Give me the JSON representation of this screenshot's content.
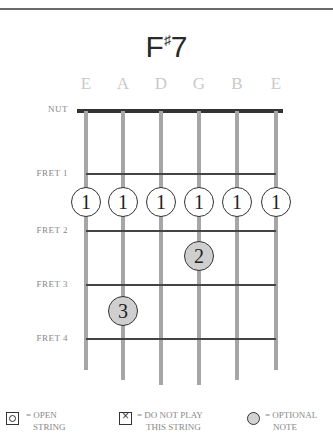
{
  "chord": {
    "root": "F",
    "accidental": "♯",
    "quality": "7"
  },
  "strings": [
    {
      "name": "E",
      "x": 86,
      "bottom": 370
    },
    {
      "name": "A",
      "x": 123,
      "bottom": 380
    },
    {
      "name": "D",
      "x": 161,
      "bottom": 385
    },
    {
      "name": "G",
      "x": 199,
      "bottom": 385
    },
    {
      "name": "B",
      "x": 237,
      "bottom": 380
    },
    {
      "name": "E",
      "x": 276,
      "bottom": 370
    }
  ],
  "nut_label": "NUT",
  "frets": [
    {
      "label": "FRET 1",
      "y": 174
    },
    {
      "label": "FRET 2",
      "y": 231
    },
    {
      "label": "FRET 3",
      "y": 285
    },
    {
      "label": "FRET 4",
      "y": 339
    }
  ],
  "fingers": [
    {
      "string": 0,
      "finger": "1",
      "y": 202,
      "shaded": false
    },
    {
      "string": 1,
      "finger": "1",
      "y": 202,
      "shaded": false
    },
    {
      "string": 2,
      "finger": "1",
      "y": 202,
      "shaded": false
    },
    {
      "string": 3,
      "finger": "1",
      "y": 202,
      "shaded": false
    },
    {
      "string": 4,
      "finger": "1",
      "y": 202,
      "shaded": false
    },
    {
      "string": 5,
      "finger": "1",
      "y": 202,
      "shaded": false
    },
    {
      "string": 3,
      "finger": "2",
      "y": 256,
      "shaded": true
    },
    {
      "string": 1,
      "finger": "3",
      "y": 311,
      "shaded": true
    }
  ],
  "legend": {
    "open": {
      "line1": "= OPEN",
      "line2": "STRING"
    },
    "mute": {
      "line1": "= DO NOT PLAY",
      "line2": "THIS STRING"
    },
    "optional": {
      "line1": "= OPTIONAL",
      "line2": "NOTE"
    }
  }
}
